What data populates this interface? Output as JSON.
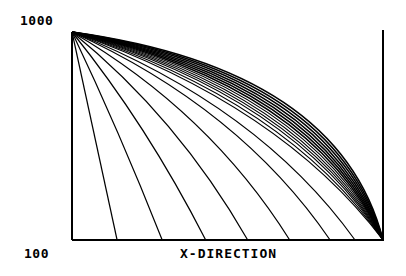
{
  "chart_data": {
    "type": "line",
    "title": "",
    "xlabel": "X-DIRECTION",
    "ylabel": "",
    "y_tick_labels": [
      "1000",
      "100"
    ],
    "ylim": [
      100,
      1000
    ],
    "grid": false,
    "legend": null,
    "series_endpoints_x_fraction": [
      0.145,
      0.29,
      0.43,
      0.565,
      0.7,
      0.83,
      0.91,
      1.0,
      1.0,
      1.0,
      1.0,
      1.0,
      1.0,
      1.0,
      1.0,
      1.0,
      1.0,
      1.0,
      1.0,
      1.0
    ],
    "series_bow": [
      0.0,
      0.05,
      0.12,
      0.2,
      0.26,
      0.3,
      0.32,
      0.34,
      0.38,
      0.42,
      0.45,
      0.48,
      0.51,
      0.54,
      0.57,
      0.6,
      0.63,
      0.66,
      0.69,
      0.72
    ]
  },
  "labels": {
    "y_top": "1000",
    "y_bottom": "100",
    "x_axis": "X-DIRECTION"
  }
}
